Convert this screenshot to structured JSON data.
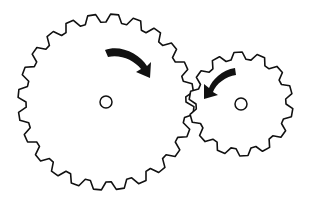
{
  "diagram": {
    "type": "meshing-gears",
    "background": "#ffffff",
    "stroke": "#111111",
    "gears": [
      {
        "name": "large-gear",
        "cx": 106,
        "cy": 102,
        "outer_r": 88,
        "root_r": 80,
        "teeth": 24,
        "hub_r": 6,
        "rotation": "clockwise"
      },
      {
        "name": "small-gear",
        "cx": 241,
        "cy": 104,
        "outer_r": 52,
        "root_r": 45,
        "teeth": 14,
        "hub_r": 6,
        "rotation": "counterclockwise"
      }
    ]
  }
}
